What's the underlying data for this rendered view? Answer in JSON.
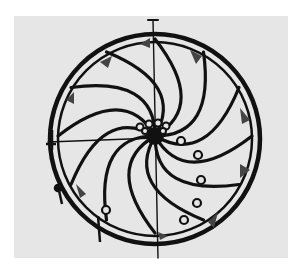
{
  "figure": {
    "background_color": "#e6e6e6",
    "ink_color": "#111111",
    "wheel": {
      "center": [
        155,
        138
      ],
      "outer_radius": 104,
      "inner_radius": 97,
      "spoke_count": 12,
      "spoke_style": "curved"
    }
  }
}
